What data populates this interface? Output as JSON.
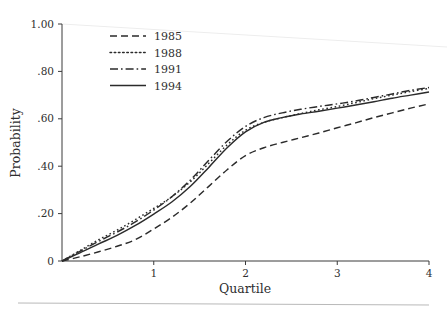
{
  "chart_data": {
    "type": "line",
    "title": "",
    "subtitle": "",
    "xlabel": "Quartile",
    "ylabel": "Probability",
    "xlim": [
      0,
      4
    ],
    "ylim": [
      0,
      1.0
    ],
    "xticks": [
      1,
      2,
      3,
      4
    ],
    "xtick_labels": [
      "1",
      "2",
      "3",
      "4"
    ],
    "yticks": [
      0,
      0.2,
      0.4,
      0.6,
      0.8,
      1.0
    ],
    "ytick_labels": [
      "0",
      ".20",
      ".40",
      ".60",
      ".80",
      "1.00"
    ],
    "grid": false,
    "legend_position": "upper-left-inside",
    "x": [
      0,
      0.2,
      0.4,
      0.6,
      0.8,
      1.0,
      1.2,
      1.4,
      1.6,
      1.8,
      2.0,
      2.2,
      2.4,
      2.6,
      2.8,
      3.0,
      3.2,
      3.4,
      3.6,
      3.8,
      4.0
    ],
    "series": [
      {
        "name": "1985",
        "label": "1985",
        "dash": "dashed",
        "dasharray": "7,4",
        "color": "#2b2b2b",
        "values": [
          0.0,
          0.018,
          0.039,
          0.062,
          0.09,
          0.135,
          0.185,
          0.245,
          0.315,
          0.385,
          0.445,
          0.478,
          0.5,
          0.52,
          0.54,
          0.562,
          0.583,
          0.605,
          0.625,
          0.645,
          0.663
        ]
      },
      {
        "name": "1988",
        "label": "1988",
        "dash": "dotted",
        "dasharray": "1.6,2.6",
        "color": "#2b2b2b",
        "values": [
          0.0,
          0.045,
          0.09,
          0.13,
          0.175,
          0.222,
          0.272,
          0.335,
          0.412,
          0.49,
          0.552,
          0.585,
          0.605,
          0.622,
          0.638,
          0.652,
          0.668,
          0.685,
          0.7,
          0.715,
          0.728
        ]
      },
      {
        "name": "1991",
        "label": "1991",
        "dash": "dashdot",
        "dasharray": "8,3,1.6,3",
        "color": "#2b2b2b",
        "values": [
          0.0,
          0.042,
          0.083,
          0.122,
          0.165,
          0.215,
          0.272,
          0.342,
          0.425,
          0.505,
          0.568,
          0.605,
          0.625,
          0.64,
          0.652,
          0.663,
          0.675,
          0.69,
          0.705,
          0.72,
          0.732
        ]
      },
      {
        "name": "1994",
        "label": "1994",
        "dash": "solid",
        "dasharray": "",
        "color": "#2b2b2b",
        "values": [
          0.0,
          0.035,
          0.072,
          0.108,
          0.15,
          0.198,
          0.25,
          0.315,
          0.395,
          0.478,
          0.545,
          0.585,
          0.605,
          0.62,
          0.632,
          0.645,
          0.658,
          0.672,
          0.687,
          0.7,
          0.713
        ]
      }
    ]
  },
  "legend": {
    "entries": [
      {
        "label": "1985"
      },
      {
        "label": "1988"
      },
      {
        "label": "1991"
      },
      {
        "label": "1994"
      }
    ]
  }
}
